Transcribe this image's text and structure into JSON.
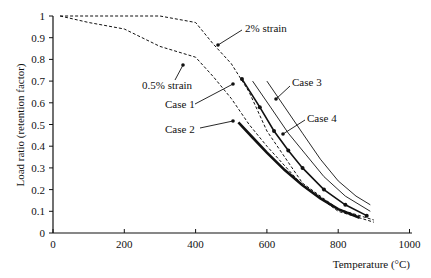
{
  "chart_data": {
    "type": "line",
    "title": "",
    "xlabel": "Temperature (°C)",
    "ylabel": "Load ratio (retention factor)",
    "xlim": [
      0,
      1000
    ],
    "ylim": [
      0,
      1
    ],
    "xticks": [
      0,
      200,
      400,
      600,
      800,
      1000
    ],
    "yticks": [
      0,
      0.1,
      0.2,
      0.3,
      0.4,
      0.5,
      0.6,
      0.7,
      0.8,
      0.9,
      1
    ],
    "grid": false,
    "series": [
      {
        "name": "2% strain",
        "style": "dashed",
        "x": [
          20,
          100,
          200,
          300,
          400,
          450,
          500,
          550,
          600,
          700,
          800,
          900
        ],
        "y": [
          1.0,
          1.0,
          1.0,
          1.0,
          0.97,
          0.87,
          0.78,
          0.65,
          0.47,
          0.23,
          0.11,
          0.06
        ]
      },
      {
        "name": "0.5% strain",
        "style": "dashed",
        "x": [
          20,
          100,
          200,
          300,
          400,
          450,
          500,
          550,
          600,
          700,
          800,
          900
        ],
        "y": [
          1.0,
          0.97,
          0.94,
          0.86,
          0.81,
          0.72,
          0.62,
          0.5,
          0.4,
          0.22,
          0.1,
          0.05
        ]
      },
      {
        "name": "Case 1",
        "style": "solid-markers",
        "x": [
          530,
          580,
          620,
          660,
          700,
          760,
          820,
          880
        ],
        "y": [
          0.71,
          0.58,
          0.47,
          0.38,
          0.3,
          0.2,
          0.13,
          0.08
        ]
      },
      {
        "name": "Case 2",
        "style": "bold",
        "x": [
          520,
          560,
          600,
          650,
          700,
          750,
          800,
          860
        ],
        "y": [
          0.51,
          0.44,
          0.37,
          0.29,
          0.22,
          0.16,
          0.11,
          0.07
        ]
      },
      {
        "name": "Case 3",
        "style": "thin",
        "x": [
          600,
          650,
          700,
          750,
          800,
          850,
          890
        ],
        "y": [
          0.7,
          0.58,
          0.46,
          0.34,
          0.24,
          0.17,
          0.13
        ]
      },
      {
        "name": "Case 4",
        "style": "thin",
        "x": [
          560,
          610,
          660,
          710,
          760,
          820,
          890
        ],
        "y": [
          0.7,
          0.58,
          0.46,
          0.36,
          0.26,
          0.17,
          0.1
        ]
      }
    ],
    "annotations": [
      {
        "text": "2% strain",
        "x": 245,
        "y": 32
      },
      {
        "text": "0.5% strain",
        "x": 142,
        "y": 89
      },
      {
        "text": "Case 1",
        "x": 165,
        "y": 108
      },
      {
        "text": "Case 2",
        "x": 165,
        "y": 133
      },
      {
        "text": "Case 3",
        "x": 292,
        "y": 86
      },
      {
        "text": "Case 4",
        "x": 307,
        "y": 122
      }
    ]
  }
}
